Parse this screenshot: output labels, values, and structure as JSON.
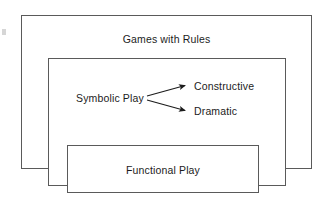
{
  "diagram": {
    "title_implicit": "Nested play categories diagram",
    "boxes": [
      {
        "id": "games",
        "label": "Games with Rules"
      },
      {
        "id": "symbolic",
        "label": ""
      },
      {
        "id": "functional",
        "label": "Functional Play"
      }
    ],
    "labels": {
      "games_with_rules": "Games with Rules",
      "symbolic_play": "Symbolic Play",
      "constructive": "Constructive",
      "dramatic": "Dramatic",
      "functional_play": "Functional Play"
    },
    "arrows": [
      {
        "from": "Symbolic Play",
        "to": "Constructive"
      },
      {
        "from": "Symbolic Play",
        "to": "Dramatic"
      }
    ],
    "colors": {
      "background": "#ffffff",
      "border": "#5a5a5a",
      "text": "#1c1c1c",
      "arrow": "#1c1c1c"
    }
  }
}
